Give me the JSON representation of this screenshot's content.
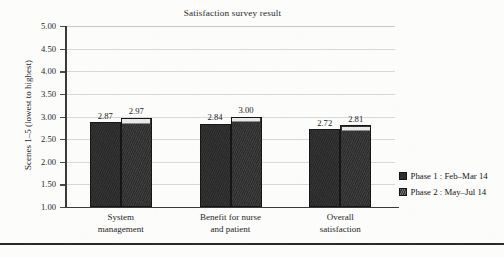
{
  "chart_data": {
    "type": "bar",
    "title": "Satisfaction survey result",
    "xlabel": "",
    "ylabel": "Scenes 1–5 (lowest to highest)",
    "ylim": [
      1.0,
      5.0
    ],
    "ytick_step": 0.5,
    "ytick_labels": [
      "5.00",
      "4.50",
      "4.00",
      "3.50",
      "3.00",
      "2.50",
      "2.00",
      "1.50",
      "1.00"
    ],
    "ytick_values": [
      5.0,
      4.5,
      4.0,
      3.5,
      3.0,
      2.5,
      2.0,
      1.5,
      1.0
    ],
    "grid": true,
    "grid_axis": "y",
    "legend_position": "right",
    "categories": [
      "System management",
      "Benefit for nurse and patient",
      "Overall satisfaction"
    ],
    "category_lines": [
      [
        "System",
        "management"
      ],
      [
        "Benefit for nurse",
        "and patient"
      ],
      [
        "Overall",
        "satisfaction"
      ]
    ],
    "series": [
      {
        "name": "Phase 1 : Feb–Mar 14",
        "values": [
          2.87,
          2.84,
          2.72
        ],
        "labels": [
          "2.87",
          "2.84",
          "2.72"
        ],
        "color": "#2b2b2b"
      },
      {
        "name": "Phase 2 : May–Jul 14",
        "values": [
          2.97,
          3.0,
          2.81
        ],
        "labels": [
          "2.97",
          "3.00",
          "2.81"
        ],
        "color": "#2f2f2f"
      }
    ]
  },
  "legend": {
    "items": [
      {
        "label": "Phase 1 : Feb–Mar 14",
        "swatch": "phase1-swatch"
      },
      {
        "label": "Phase 2 : May–Jul 14",
        "swatch": "phase2-swatch"
      }
    ]
  },
  "colors": {
    "background": "#fcfcfb",
    "bar_phase1": "#2b2b2b",
    "bar_phase2": "#2f2f2f",
    "phase2_highlight": "#e9e9e9",
    "gridline": "#d8d8d8",
    "axis": "#3a3a3a",
    "text": "#1a1a1a",
    "bottom_rule": "#2a2a2a"
  }
}
